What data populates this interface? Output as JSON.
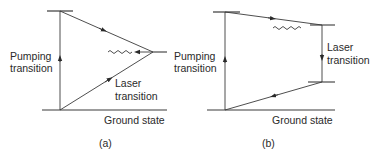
{
  "diagram_a": {
    "caption": "(a)",
    "labels": {
      "pumping_line1": "Pumping",
      "pumping_line2": "transition",
      "laser_line1": "Laser",
      "laser_line2": "transition",
      "ground_state": "Ground state"
    }
  },
  "diagram_b": {
    "caption": "(b)",
    "labels": {
      "laser_line1": "Laser",
      "laser_line2": "transition",
      "ground_state": "Ground state"
    }
  },
  "colors": {
    "line": "#3a3a3a",
    "text": "#2a2a2a"
  }
}
